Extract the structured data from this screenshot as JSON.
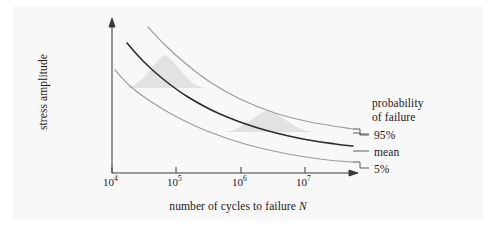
{
  "figure": {
    "background_color": "#ffffff",
    "panel_color": "#f8f8f8"
  },
  "chart_data": {
    "type": "line",
    "title": "",
    "xlabel": "number of cycles to failure N",
    "ylabel": "stress amplitude",
    "x_scale": "log",
    "y_scale": "linear",
    "grid": false,
    "legend_position": "right",
    "xticks": [
      "10",
      "10",
      "10",
      "10"
    ],
    "xtick_exponents": [
      "4",
      "5",
      "6",
      "7"
    ],
    "xtick_values": [
      10000,
      100000,
      1000000,
      10000000
    ],
    "yticks": [],
    "axis_arrows": true,
    "series": [
      {
        "name": "95%",
        "label": "95%",
        "color": "#9a9a9a",
        "width": 1.1,
        "description": "upper bound S-N curve, 95% probability of failure",
        "points": [
          [
            148,
            27
          ],
          [
            165,
            45
          ],
          [
            185,
            63
          ],
          [
            210,
            82
          ],
          [
            240,
            99
          ],
          [
            275,
            113
          ],
          [
            310,
            122
          ],
          [
            340,
            127
          ],
          [
            353,
            129
          ]
        ]
      },
      {
        "name": "mean",
        "label": "mean",
        "color": "#2b2b2b",
        "width": 1.6,
        "description": "mean S-N curve, 50% probability of failure",
        "points": [
          [
            127,
            43
          ],
          [
            143,
            61
          ],
          [
            163,
            79
          ],
          [
            188,
            97
          ],
          [
            220,
            114
          ],
          [
            258,
            128
          ],
          [
            298,
            138
          ],
          [
            335,
            144
          ],
          [
            353,
            146
          ]
        ]
      },
      {
        "name": "5%",
        "label": "5%",
        "color": "#9a9a9a",
        "width": 1.1,
        "description": "lower bound S-N curve, 5% probability of failure",
        "points": [
          [
            115,
            70
          ],
          [
            130,
            86
          ],
          [
            150,
            101
          ],
          [
            175,
            116
          ],
          [
            207,
            131
          ],
          [
            245,
            144
          ],
          [
            288,
            154
          ],
          [
            328,
            160
          ],
          [
            353,
            162
          ]
        ]
      }
    ],
    "distributions": [
      {
        "name": "distribution-1",
        "color": "#e2e2e2",
        "description": "scatter distribution of failure at low cycle count",
        "apex": [
          165,
          55
        ],
        "left": [
          124,
          88
        ],
        "right": [
          207,
          88
        ]
      },
      {
        "name": "distribution-2",
        "color": "#e2e2e2",
        "description": "scatter distribution of failure at high cycle count",
        "apex": [
          268,
          110
        ],
        "left": [
          222,
          132
        ],
        "right": [
          316,
          132
        ]
      }
    ],
    "annotations": [
      {
        "text": "probability",
        "x": 372,
        "y": 97
      },
      {
        "text": "of failure",
        "x": 372,
        "y": 110
      }
    ]
  },
  "axes": {
    "y_axis_label": "stress amplitude",
    "x_axis_label_prefix": "number of cycles to failure ",
    "x_axis_label_symbol": "N",
    "tick_10_4_mantissa": "10",
    "tick_10_4_exp": "4",
    "tick_10_5_mantissa": "10",
    "tick_10_5_exp": "5",
    "tick_10_6_mantissa": "10",
    "tick_10_6_exp": "6",
    "tick_10_7_mantissa": "10",
    "tick_10_7_exp": "7"
  },
  "legend": {
    "title_line1": "probability",
    "title_line2": "of failure",
    "item_upper": "95%",
    "item_mean": "mean",
    "item_lower": "5%"
  }
}
